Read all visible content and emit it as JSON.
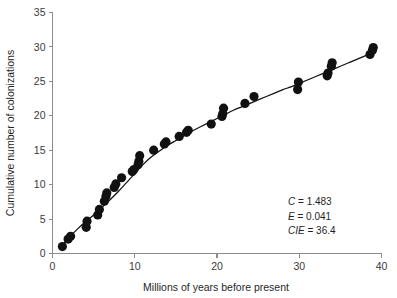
{
  "chart_data": {
    "type": "scatter",
    "title": "",
    "xlabel": "Millions of years before present",
    "ylabel": "Cumulative number of colonizations",
    "xlim": [
      0,
      40
    ],
    "ylim": [
      0,
      35
    ],
    "xticks": [
      0,
      10,
      20,
      30,
      40
    ],
    "yticks": [
      0,
      5,
      10,
      15,
      20,
      25,
      30,
      35
    ],
    "grid": false,
    "legend": null,
    "series": [
      {
        "name": "colonization events",
        "marker": "filled-circle",
        "color": "#111111",
        "points": [
          [
            1.2,
            1.0
          ],
          [
            1.9,
            2.1
          ],
          [
            2.2,
            2.5
          ],
          [
            4.1,
            3.8
          ],
          [
            4.2,
            4.7
          ],
          [
            5.5,
            5.6
          ],
          [
            5.7,
            6.4
          ],
          [
            6.3,
            7.6
          ],
          [
            6.5,
            8.3
          ],
          [
            6.6,
            8.8
          ],
          [
            7.5,
            9.6
          ],
          [
            7.7,
            10.1
          ],
          [
            8.4,
            11.0
          ],
          [
            9.7,
            11.9
          ],
          [
            9.9,
            12.2
          ],
          [
            10.4,
            12.9
          ],
          [
            10.5,
            13.4
          ],
          [
            10.6,
            14.2
          ],
          [
            12.3,
            15.0
          ],
          [
            13.6,
            15.9
          ],
          [
            13.8,
            16.2
          ],
          [
            15.4,
            17.0
          ],
          [
            16.3,
            17.6
          ],
          [
            16.5,
            17.9
          ],
          [
            19.3,
            18.8
          ],
          [
            20.6,
            19.9
          ],
          [
            20.7,
            20.3
          ],
          [
            20.8,
            21.1
          ],
          [
            23.4,
            21.8
          ],
          [
            24.5,
            22.8
          ],
          [
            29.8,
            23.8
          ],
          [
            29.9,
            24.9
          ],
          [
            33.4,
            25.8
          ],
          [
            33.5,
            26.2
          ],
          [
            33.9,
            27.2
          ],
          [
            34.0,
            27.7
          ],
          [
            38.6,
            28.9
          ],
          [
            38.9,
            29.5
          ],
          [
            39.0,
            29.9
          ]
        ]
      }
    ],
    "fit_curve": {
      "name": "fitted colonization curve",
      "color": "#111111",
      "points": [
        [
          1.0,
          1.0
        ],
        [
          2.0,
          2.3
        ],
        [
          3.0,
          3.5
        ],
        [
          4.0,
          4.6
        ],
        [
          5.0,
          5.6
        ],
        [
          6.0,
          6.7
        ],
        [
          7.0,
          7.8
        ],
        [
          8.0,
          9.0
        ],
        [
          9.0,
          10.3
        ],
        [
          10.0,
          11.6
        ],
        [
          11.0,
          12.9
        ],
        [
          12.0,
          14.0
        ],
        [
          13.0,
          14.9
        ],
        [
          14.0,
          15.7
        ],
        [
          15.0,
          16.4
        ],
        [
          16.0,
          17.1
        ],
        [
          17.0,
          17.8
        ],
        [
          18.0,
          18.4
        ],
        [
          19.0,
          19.0
        ],
        [
          20.0,
          19.6
        ],
        [
          21.0,
          20.2
        ],
        [
          22.0,
          20.8
        ],
        [
          23.0,
          21.3
        ],
        [
          24.0,
          21.8
        ],
        [
          25.0,
          22.3
        ],
        [
          26.0,
          22.8
        ],
        [
          27.0,
          23.3
        ],
        [
          28.0,
          23.8
        ],
        [
          29.0,
          24.2
        ],
        [
          30.0,
          24.7
        ],
        [
          31.0,
          25.2
        ],
        [
          32.0,
          25.7
        ],
        [
          33.0,
          26.2
        ],
        [
          34.0,
          26.7
        ],
        [
          35.0,
          27.2
        ],
        [
          36.0,
          27.7
        ],
        [
          37.0,
          28.2
        ],
        [
          38.0,
          28.7
        ],
        [
          39.0,
          29.2
        ]
      ]
    },
    "annotations": [
      {
        "variable": "C",
        "separator": " = ",
        "value": "1.483"
      },
      {
        "variable": "E",
        "separator": " = ",
        "value": "0.041"
      },
      {
        "variable": "CIE",
        "separator": " = ",
        "value": "36.4"
      }
    ],
    "marker_radius_px": 4.6
  }
}
